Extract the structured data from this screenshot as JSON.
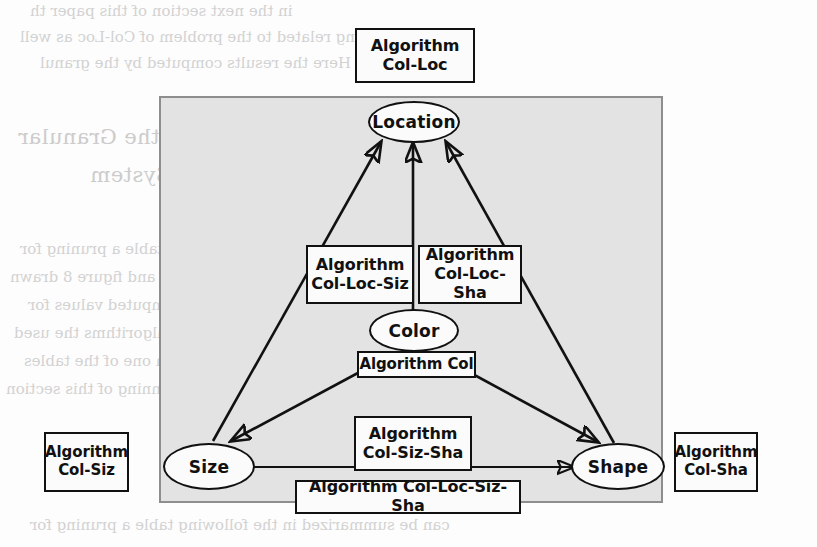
{
  "figure": {
    "type": "directed-graph-diagram",
    "panel": {
      "fill_color": "#e3e3e3",
      "border_color": "#8e8e8e"
    },
    "node_fill": "#fbfbfb",
    "stroke_color": "#111111"
  },
  "nodes": [
    {
      "id": "location",
      "label": "Location"
    },
    {
      "id": "color",
      "label": "Color"
    },
    {
      "id": "size",
      "label": "Size"
    },
    {
      "id": "shape",
      "label": "Shape"
    }
  ],
  "algorithm_boxes": [
    {
      "id": "col-loc",
      "line1": "Algorithm",
      "line2": "Col-Loc",
      "position": "above-panel-top-center"
    },
    {
      "id": "col-loc-siz",
      "line1": "Algorithm",
      "line2": "Col-Loc-Siz",
      "position": "center-left"
    },
    {
      "id": "col-loc-sha",
      "line1": "Algorithm",
      "line2": "Col-Loc-Sha",
      "position": "center-right"
    },
    {
      "id": "col",
      "line1": "Algorithm Col",
      "line2": "",
      "position": "below-color-node"
    },
    {
      "id": "col-siz",
      "line1": "Algorithm",
      "line2": "Col-Siz",
      "position": "outside-left"
    },
    {
      "id": "col-sha",
      "line1": "Algorithm",
      "line2": "Col-Sha",
      "position": "outside-right"
    },
    {
      "id": "col-siz-sha",
      "line1": "Algorithm",
      "line2": "Col-Siz-Sha",
      "position": "bottom-center"
    },
    {
      "id": "col-loc-siz-sha",
      "line1": "Algorithm Col-Loc-Siz-Sha",
      "line2": "",
      "position": "bottom-across"
    }
  ],
  "edges": [
    {
      "from": "size",
      "to": "location",
      "arrow": "single"
    },
    {
      "from": "color",
      "to": "location",
      "arrow": "single"
    },
    {
      "from": "shape",
      "to": "location",
      "arrow": "single"
    },
    {
      "from": "color",
      "to": "size",
      "arrow": "single"
    },
    {
      "from": "color",
      "to": "shape",
      "arrow": "single"
    },
    {
      "from": "size",
      "to": "shape",
      "arrow": "double"
    }
  ],
  "background_bleed_text": [
    "the",
    "or",
    "the",
    "in",
    "with",
    "on",
    "in",
    "Algorithms Reviewed by the Granular",
    "Integration System",
    "in the next section of this paper th",
    "everything related to the problem of Col-Loc as well",
    "algorithms. Here the results computed by the granul",
    "can be summarized in the following table a pruning for",
    "No one of all more extensive and then, TEF and figure 8 drawn",
    "algorithm also that the variables are the computed values for",
    "research on the results for all the algorithms the used",
    "and described in the column of each one of the tables",
    "by the partial of the all at the beginning of this section"
  ]
}
